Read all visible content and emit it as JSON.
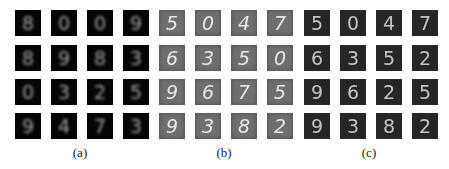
{
  "figure": {
    "panels": [
      {
        "caption": "(a)",
        "background": "#050505",
        "digits": [
          [
            "8",
            "0",
            "0",
            "9"
          ],
          [
            "8",
            "9",
            "8",
            "3"
          ],
          [
            "0",
            "3",
            "2",
            "5"
          ],
          [
            "9",
            "4",
            "7",
            "3"
          ]
        ]
      },
      {
        "caption": "(b)",
        "background": "#6f6f6f",
        "digits": [
          [
            "5",
            "0",
            "4",
            "7"
          ],
          [
            "6",
            "3",
            "5",
            "0"
          ],
          [
            "9",
            "6",
            "7",
            "5"
          ],
          [
            "9",
            "3",
            "8",
            "2"
          ]
        ]
      },
      {
        "caption": "(c)",
        "background": "#262626",
        "digits": [
          [
            "5",
            "0",
            "4",
            "7"
          ],
          [
            "6",
            "3",
            "5",
            "2"
          ],
          [
            "9",
            "6",
            "2",
            "5"
          ],
          [
            "9",
            "3",
            "8",
            "2"
          ]
        ]
      }
    ]
  }
}
